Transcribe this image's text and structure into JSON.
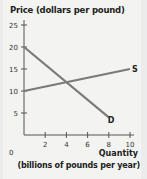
{
  "chart_data": {
    "type": "line",
    "title": "",
    "ylabel": "Price (dollars per pound)",
    "xlabel": "Quantity",
    "xlabel_sub": "(billions of pounds per year)",
    "x_ticks": [
      0,
      2,
      4,
      6,
      8,
      10
    ],
    "y_ticks": [
      5,
      10,
      15,
      20,
      25
    ],
    "xlim": [
      0,
      10
    ],
    "ylim": [
      0,
      25
    ],
    "grid": false,
    "legend": "none (inline curve labels)",
    "series": [
      {
        "name": "S",
        "x": [
          0,
          10
        ],
        "y": [
          10,
          15
        ],
        "color": "#7a7a7a"
      },
      {
        "name": "D",
        "x": [
          0,
          8
        ],
        "y": [
          20,
          4
        ],
        "color": "#7a7a7a"
      }
    ],
    "equilibrium": {
      "x": 4,
      "y": 12
    }
  },
  "labels": {
    "y_axis": "Price (dollars per pound)",
    "x_axis": "Quantity",
    "x_axis_sub": "(billions of pounds per year)",
    "origin": "0",
    "supply": "S",
    "demand": "D"
  }
}
